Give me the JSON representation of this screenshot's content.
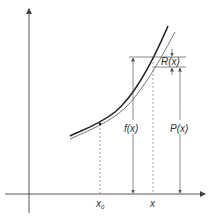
{
  "diagram": {
    "type": "taylor-approximation",
    "labels": {
      "x0": "x",
      "x0_sub": "0",
      "x": "x",
      "f": "f(x)",
      "P": "P(x)",
      "R": "R(x)"
    },
    "colors": {
      "axis": "#444444",
      "curve_f": "#222222",
      "curve_P": "#666666",
      "guide": "#555555",
      "dashed": "#888888",
      "text": "#333333"
    },
    "curves": [
      {
        "name": "f(x)",
        "style": "thick"
      },
      {
        "name": "P(x)",
        "style": "thin"
      }
    ]
  }
}
